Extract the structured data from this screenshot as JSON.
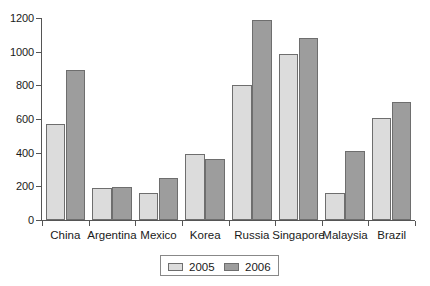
{
  "chart_data": {
    "type": "bar",
    "title": "",
    "subtitle": "",
    "xlabel": "",
    "ylabel": "",
    "categories": [
      "China",
      "Argentina",
      "Mexico",
      "Korea",
      "Russia",
      "Singapore",
      "Malaysia",
      "Brazil"
    ],
    "series": [
      {
        "name": "2005",
        "color": "#dcdcdc",
        "values": [
          570,
          188,
          160,
          390,
          805,
          985,
          160,
          605
        ]
      },
      {
        "name": "2006",
        "color": "#9d9d9d",
        "values": [
          890,
          195,
          250,
          365,
          1190,
          1080,
          410,
          700
        ]
      }
    ],
    "ylim": [
      0,
      1200
    ],
    "yticks": [
      0,
      200,
      400,
      600,
      800,
      1000,
      1200
    ],
    "ytick_labels": [
      "0",
      "200",
      "400",
      "600",
      "800",
      "1000",
      "1200"
    ],
    "grid": false,
    "legend_position": "bottom",
    "legend_entries": [
      "2005",
      "2006"
    ]
  }
}
